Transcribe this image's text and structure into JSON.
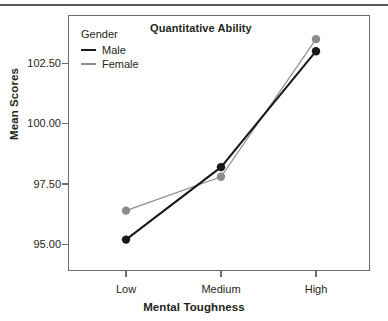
{
  "chart_data": {
    "type": "line",
    "title": "Quantitative Ability",
    "xlabel": "Mental Toughness",
    "ylabel": "Mean Scores",
    "categories": [
      "Low",
      "Medium",
      "High"
    ],
    "series": [
      {
        "name": "Male",
        "values": [
          95.2,
          98.2,
          103.0
        ],
        "color": "#17181a",
        "line_width": 2.0,
        "marker": "circle"
      },
      {
        "name": "Female",
        "values": [
          96.4,
          97.8,
          103.5
        ],
        "color": "#8a8c8e",
        "line_width": 1.2,
        "marker": "circle"
      }
    ],
    "legend_title": "Gender",
    "legend_position": "inside-top-left",
    "ytick_labels": [
      "102.50",
      "100.00",
      "97.50",
      "95.00"
    ],
    "ytick_values": [
      102.5,
      100.0,
      97.5,
      95.0
    ],
    "ylim": [
      93.9,
      104.5
    ],
    "grid": false,
    "frame": true
  },
  "colors": {
    "male": "#17181a",
    "female": "#8a8c8e",
    "frame": "#6d6e71",
    "rule": "#53565a",
    "text": "#231f20"
  }
}
